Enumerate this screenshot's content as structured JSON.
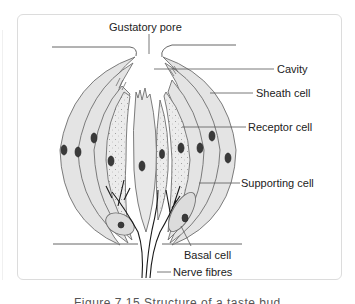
{
  "diagram": {
    "labels": {
      "gustatory_pore": "Gustatory pore",
      "cavity": "Cavity",
      "sheath_cell": "Sheath cell",
      "receptor_cell": "Receptor cell",
      "supporting_cell": "Supporting cell",
      "basal_cell": "Basal cell",
      "nerve_fibres": "Nerve fibres"
    },
    "caption": "Figure 7.15 Structure of a taste bud",
    "colors": {
      "cell_fill": "#e4e4e4",
      "cell_stroke": "#6e6e6e",
      "nucleus": "#3a3a3a",
      "nerve": "#1a1a1a",
      "frame_border": "#dcdcdc",
      "text": "#222222"
    }
  }
}
